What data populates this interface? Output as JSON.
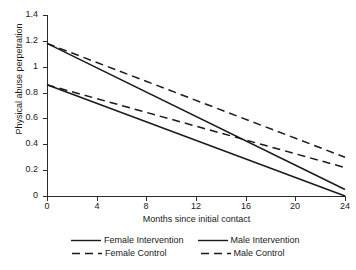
{
  "chart_data": {
    "type": "line",
    "title": "",
    "xlabel": "Months since initial contact",
    "ylabel": "Physical abuse perpetration",
    "xlim": [
      0,
      24
    ],
    "ylim": [
      0,
      1.4
    ],
    "x": [
      0,
      24
    ],
    "xticks": [
      "0",
      "4",
      "8",
      "12",
      "16",
      "20",
      "24"
    ],
    "xtick_values": [
      0,
      4,
      8,
      12,
      16,
      20,
      24
    ],
    "yticks": [
      "0",
      "0.2",
      "0.4",
      "0.6",
      "0.8",
      "1",
      "1.2",
      "1.4"
    ],
    "ytick_values": [
      0,
      0.2,
      0.4,
      0.6,
      0.8,
      1.0,
      1.2,
      1.4
    ],
    "grid": false,
    "legend_position": "below",
    "series": [
      {
        "name": "Female Intervention",
        "style": "solid",
        "color": "#1a1a1a",
        "x": [
          0,
          24
        ],
        "values": [
          0.86,
          0.0
        ]
      },
      {
        "name": "Male Intervention",
        "style": "solid",
        "color": "#1a1a1a",
        "x": [
          0,
          24
        ],
        "values": [
          1.18,
          0.05
        ]
      },
      {
        "name": "Female Control",
        "style": "dashed",
        "color": "#1a1a1a",
        "x": [
          0,
          24
        ],
        "values": [
          0.86,
          0.22
        ]
      },
      {
        "name": "Male Control",
        "style": "dashed",
        "color": "#1a1a1a",
        "x": [
          0,
          24
        ],
        "values": [
          1.18,
          0.3
        ]
      }
    ]
  },
  "legend": {
    "row_1": [
      "Female Intervention",
      "Male Intervention"
    ],
    "row_2": [
      "Female Control",
      "Male Control"
    ]
  }
}
